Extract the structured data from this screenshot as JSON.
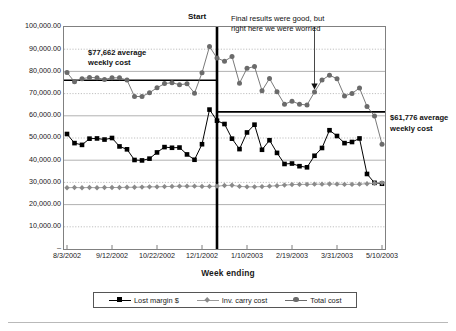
{
  "chart_data": {
    "type": "line",
    "title": "",
    "xlabel": "Week ending",
    "ylabel": "",
    "ylim": [
      0,
      100000
    ],
    "grid": true,
    "legend_position": "bottom",
    "ytick_labels": [
      "100,000.00",
      "90,000.00",
      "80,000.00",
      "70,000.00",
      "60,000.00",
      "50,000.00",
      "40,000.00",
      "30,000.00",
      "20,000.00",
      "10,000.00",
      "–"
    ],
    "ytick_values": [
      100000,
      90000,
      80000,
      70000,
      60000,
      50000,
      40000,
      30000,
      20000,
      10000,
      0
    ],
    "xtick_labels": [
      "8/3/2002",
      "9/12/2002",
      "10/22/2002",
      "12/1/2002",
      "1/10/2003",
      "2/19/2003",
      "3/31/2003",
      "5/10/2003"
    ],
    "xtick_indices": [
      0,
      6,
      12,
      18,
      24,
      30,
      36,
      42
    ],
    "x": [
      "8/3/2002",
      "8/10/2002",
      "8/17/2002",
      "8/24/2002",
      "8/31/2002",
      "9/5/2002",
      "9/12/2002",
      "9/19/2002",
      "9/26/2002",
      "10/3/2002",
      "10/10/2002",
      "10/15/2002",
      "10/22/2002",
      "10/29/2002",
      "11/5/2002",
      "11/12/2002",
      "11/19/2002",
      "11/24/2002",
      "12/1/2002",
      "12/8/2002",
      "12/14/2002",
      "12/21/2002",
      "12/28/2002",
      "1/4/2003",
      "1/10/2003",
      "1/17/2003",
      "1/24/2003",
      "1/31/2003",
      "2/7/2003",
      "2/12/2003",
      "2/19/2003",
      "2/26/2003",
      "3/5/2003",
      "3/12/2003",
      "3/19/2003",
      "3/24/2003",
      "3/31/2003",
      "4/7/2003",
      "4/14/2003",
      "4/21/2003",
      "4/28/2003",
      "5/3/2003",
      "5/10/2003"
    ],
    "series": [
      {
        "name": "Lost margin $",
        "marker": "square",
        "color": "#000000",
        "values": [
          51800,
          47700,
          46900,
          49700,
          49800,
          49300,
          50000,
          46200,
          44900,
          40100,
          39900,
          40700,
          43500,
          45900,
          45600,
          45700,
          42600,
          40200,
          47200,
          62800,
          57800,
          56300,
          49700,
          45000,
          52500,
          56000,
          44700,
          49000,
          43300,
          38300,
          38500,
          37300,
          36800,
          42000,
          45500,
          53500,
          50900,
          47700,
          48200,
          49800,
          33800,
          29800,
          29400
        ]
      },
      {
        "name": "Inv. carry cost",
        "marker": "diamond",
        "color": "#8a8a8a",
        "values": [
          27600,
          27700,
          27600,
          27700,
          27600,
          27700,
          27700,
          27700,
          27800,
          27800,
          27900,
          28000,
          28000,
          28100,
          28200,
          28300,
          28300,
          28300,
          28200,
          28200,
          28300,
          28600,
          28700,
          28200,
          28000,
          28000,
          28100,
          28300,
          28500,
          28800,
          29000,
          29100,
          29100,
          29200,
          29200,
          29300,
          29200,
          29100,
          29100,
          29200,
          29400,
          29600,
          29800
        ]
      },
      {
        "name": "Total cost",
        "marker": "circle",
        "color": "#6b6b6b",
        "values": [
          79500,
          75300,
          76700,
          77300,
          77100,
          76400,
          77100,
          77100,
          76100,
          68700,
          68700,
          70400,
          72600,
          74500,
          74900,
          74000,
          74400,
          70200,
          79400,
          91200,
          86000,
          84600,
          86700,
          74700,
          81400,
          82200,
          71300,
          76800,
          70800,
          65200,
          66600,
          65200,
          64900,
          70700,
          76100,
          78300,
          76700,
          68900,
          70100,
          72500,
          64200,
          59900,
          47200
        ]
      }
    ],
    "reference_lines": [
      {
        "name": "pre-start-average",
        "value": 76000,
        "label": "$77,662 average\nweekly cost",
        "span": "start-of-chart-to-start-line"
      },
      {
        "name": "post-start-average",
        "value": 61776,
        "label": "$61,776 average weekly cost",
        "span": "start-line-to-end-of-chart"
      }
    ],
    "annotations": [
      {
        "name": "start-marker",
        "text": "Start",
        "x": "12/14/2002",
        "type": "vertical-line"
      },
      {
        "name": "worry-callout",
        "text_line1": "Final results were good, but",
        "text_line2": "right here we were worried",
        "points_to": "3/12/2003",
        "type": "arrow-callout"
      },
      {
        "name": "pre-average-label",
        "text_line1": "$77,662 average",
        "text_line2": "weekly cost"
      },
      {
        "name": "post-average-label",
        "text": "$61,776 average weekly cost"
      }
    ]
  },
  "colors": {
    "lost_margin": "#000000",
    "inv_carry": "#8a8a8a",
    "total_cost": "#6b6b6b",
    "frame": "#808080",
    "grid_solid": "#a8a8a8",
    "grid_dotted": "#b0b0b0",
    "reference_line": "#000000"
  },
  "labels": {
    "axis_title": "Week ending",
    "start": "Start",
    "avg_pre_line1": "$77,662 average",
    "avg_pre_line2": "weekly cost",
    "callout_line1": "Final results were good, but",
    "callout_line2": "right here we were worried",
    "avg_post": "$61,776 average weekly cost"
  },
  "legend": {
    "items": [
      {
        "label": "Lost margin $",
        "marker": "square",
        "icon": "square-marker-icon"
      },
      {
        "label": "Inv. carry cost",
        "marker": "diamond",
        "icon": "diamond-marker-icon"
      },
      {
        "label": "Total cost",
        "marker": "circle",
        "icon": "circle-marker-icon"
      }
    ]
  }
}
